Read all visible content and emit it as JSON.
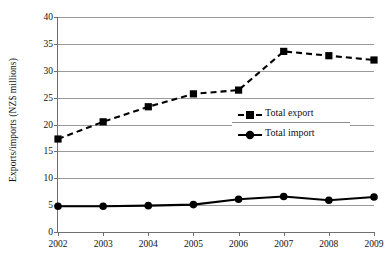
{
  "chart_data": {
    "type": "line",
    "title": "",
    "xlabel": "",
    "ylabel": "Exports/imports (NZ$ millions)",
    "categories": [
      "2002",
      "2003",
      "2004",
      "2005",
      "2006",
      "2007",
      "2008",
      "2009"
    ],
    "x": [
      2002,
      2003,
      2004,
      2005,
      2006,
      2007,
      2008,
      2009
    ],
    "xlim": [
      2002,
      2009
    ],
    "ylim": [
      0,
      40
    ],
    "yticks": [
      0,
      5,
      10,
      15,
      20,
      25,
      30,
      35,
      40
    ],
    "ytick_labels": [
      "0",
      "5",
      "10",
      "15",
      "20",
      "25",
      "30",
      "35",
      "40"
    ],
    "grid": "horizontal",
    "legend_position": "center-right",
    "series": [
      {
        "name": "Total export",
        "values": [
          17.3,
          20.5,
          23.3,
          25.7,
          26.4,
          33.6,
          32.8,
          32.0
        ],
        "marker": "square",
        "linestyle": "dashed",
        "color": "#000000"
      },
      {
        "name": "Total import",
        "values": [
          4.8,
          4.8,
          4.9,
          5.1,
          6.1,
          6.6,
          5.9,
          6.5
        ],
        "marker": "circle",
        "linestyle": "solid",
        "color": "#000000"
      }
    ]
  },
  "legend": {
    "items": [
      {
        "label": "Total export",
        "marker": "square-marker",
        "style": "dashed"
      },
      {
        "label": "Total import",
        "marker": "circle-marker",
        "style": "solid"
      }
    ]
  },
  "colors": {
    "series": "#000000",
    "gridline": "#9a9a9a",
    "axis": "#6f6f6f",
    "background": "#ffffff",
    "text": "#111111"
  }
}
